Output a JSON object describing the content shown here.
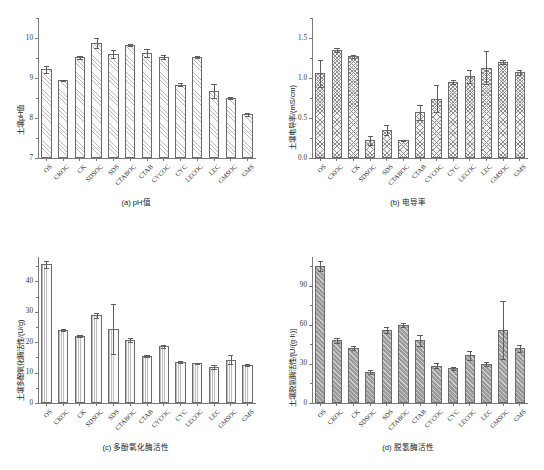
{
  "figure": {
    "categories": [
      "OS",
      "CKOC",
      "CK",
      "SDSOC",
      "SDS",
      "CTABOC",
      "CTAB",
      "CYCOC",
      "CYC",
      "LECOC",
      "LEC",
      "GMSOC",
      "GMS"
    ]
  },
  "chart_data": [
    {
      "type": "bar",
      "panel": "a",
      "title": "(a) pH值",
      "xlabel": "",
      "ylabel": "土壤pH值",
      "categories": [
        "OS",
        "CKOC",
        "CK",
        "SDSOC",
        "SDS",
        "CTABOC",
        "CTAB",
        "CYCOC",
        "CYC",
        "LECOC",
        "LEC",
        "GMSOC",
        "GMS"
      ],
      "values": [
        9.22,
        8.94,
        9.52,
        9.88,
        9.6,
        9.83,
        9.63,
        9.53,
        8.83,
        9.52,
        8.68,
        8.5,
        8.09
      ],
      "errors": [
        0.09,
        0.02,
        0.04,
        0.13,
        0.09,
        0.02,
        0.1,
        0.05,
        0.04,
        0.03,
        0.18,
        0.02,
        0.04
      ],
      "ylim": [
        7,
        10.5
      ],
      "yticks": [
        7,
        8,
        9,
        10
      ],
      "ytick_labels": [
        "7",
        "8",
        "9",
        "10"
      ],
      "grid": false,
      "legend": "none",
      "fill": "diagonal-hatch"
    },
    {
      "type": "bar",
      "panel": "b",
      "title": "(b) 电导率",
      "xlabel": "",
      "ylabel": "土壤电导率/(mS/cm)",
      "categories": [
        "OS",
        "CKOC",
        "CK",
        "SDSOC",
        "SDS",
        "CTABOC",
        "CTAB",
        "CYCOC",
        "CYC",
        "LECOC",
        "LEC",
        "GMSOC",
        "GMS"
      ],
      "values": [
        1.06,
        1.35,
        1.27,
        0.22,
        0.35,
        0.22,
        0.57,
        0.74,
        0.95,
        1.02,
        1.13,
        1.2,
        1.07
      ],
      "errors": [
        0.17,
        0.03,
        0.02,
        0.06,
        0.06,
        0.01,
        0.09,
        0.17,
        0.02,
        0.08,
        0.21,
        0.03,
        0.03
      ],
      "ylim": [
        0.0,
        1.75
      ],
      "yticks": [
        0.0,
        0.5,
        1.0,
        1.5
      ],
      "ytick_labels": [
        "0.0",
        "0.5",
        "1.0",
        "1.5"
      ],
      "grid": false,
      "legend": "none",
      "fill": "cross-hatch"
    },
    {
      "type": "bar",
      "panel": "c",
      "title": "(c) 多酚氧化酶活性",
      "xlabel": "",
      "ylabel": "土壤多酚氧化酶活性/(U/g)",
      "categories": [
        "OS",
        "CKOC",
        "CK",
        "SDSOC",
        "SDS",
        "CTABOC",
        "CTAB",
        "CYCOC",
        "CYC",
        "LECOC",
        "LEC",
        "GMSOC",
        "GMS"
      ],
      "values": [
        45.6,
        24.0,
        22.0,
        28.8,
        24.3,
        20.6,
        15.5,
        18.6,
        13.6,
        13.0,
        11.9,
        14.3,
        12.4
      ],
      "errors": [
        1.2,
        0.4,
        0.4,
        0.7,
        8.2,
        0.7,
        0.3,
        0.5,
        0.3,
        0.3,
        0.6,
        1.5,
        0.3
      ],
      "ylim": [
        0,
        48
      ],
      "yticks": [
        0,
        10,
        20,
        30,
        40
      ],
      "ytick_labels": [
        "0",
        "10",
        "20",
        "30",
        "40"
      ],
      "grid": false,
      "legend": "none",
      "fill": "vertical-line"
    },
    {
      "type": "bar",
      "panel": "d",
      "title": "(d) 脱氢酶活性",
      "xlabel": "",
      "ylabel": "土壤脱氢酶活性/[U/(g·h)]",
      "categories": [
        "OS",
        "CKOC",
        "CK",
        "SDSOC",
        "SDS",
        "CTABOC",
        "CTAB",
        "CYCOC",
        "CYC",
        "LECOC",
        "LEC",
        "GMSOC",
        "GMS"
      ],
      "values": [
        105.0,
        48.0,
        42.0,
        24.0,
        56.0,
        60.0,
        48.0,
        28.5,
        26.5,
        36.5,
        30.0,
        56.0,
        42.0
      ],
      "errors": [
        4.0,
        2.0,
        1.5,
        1.5,
        2.0,
        1.5,
        4.5,
        2.0,
        1.5,
        3.5,
        1.5,
        22.0,
        2.5
      ],
      "ylim": [
        0,
        112
      ],
      "yticks": [
        0,
        30,
        60,
        90
      ],
      "ytick_labels": [
        "0",
        "30",
        "60",
        "90"
      ],
      "grid": false,
      "legend": "none",
      "fill": "solid-gray-diagonal"
    }
  ]
}
